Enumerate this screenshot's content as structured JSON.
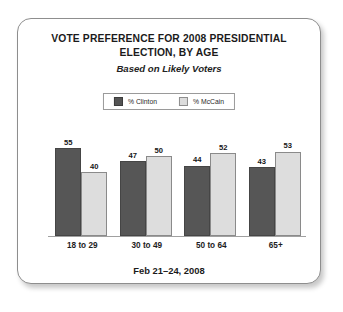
{
  "card": {
    "title": "VOTE PREFERENCE FOR 2008 PRESIDENTIAL ELECTION, BY AGE",
    "subtitle": "Based on Likely Voters",
    "footnote": "Feb 21–24, 2008"
  },
  "legend": {
    "items": [
      {
        "label": "% Clinton",
        "color": "#565656",
        "swatch_name": "clinton-swatch"
      },
      {
        "label": "% McCain",
        "color": "#dddddd",
        "swatch_name": "mccain-swatch"
      }
    ]
  },
  "chart_data": {
    "type": "bar",
    "title": "VOTE PREFERENCE FOR 2008 PRESIDENTIAL ELECTION, BY AGE",
    "subtitle": "Based on Likely Voters",
    "annotation": "Feb 21–24, 2008",
    "categories": [
      "18 to 29",
      "30 to 49",
      "50 to 64",
      "65+"
    ],
    "series": [
      {
        "name": "% Clinton",
        "color": "#565656",
        "values": [
          55,
          47,
          44,
          43
        ]
      },
      {
        "name": "% McCain",
        "color": "#dddddd",
        "values": [
          40,
          50,
          52,
          53
        ]
      }
    ],
    "xlabel": "",
    "ylabel": "",
    "ylim": [
      0,
      60
    ],
    "grid": false,
    "legend_position": "top-center",
    "value_labels": true,
    "axis_visible": {
      "x": true,
      "y": false
    }
  }
}
